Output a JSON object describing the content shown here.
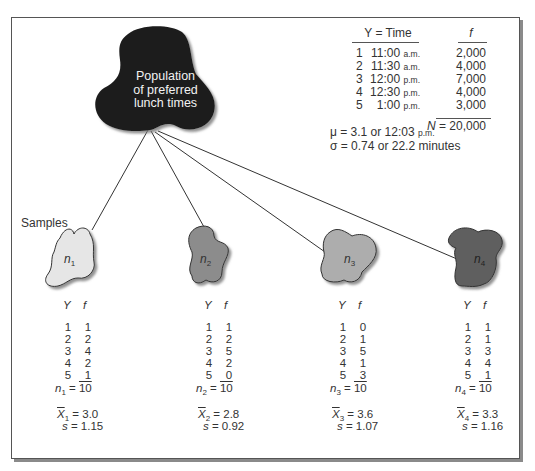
{
  "population": {
    "label_lines": [
      "Population",
      "of preferred",
      "lunch times"
    ],
    "fill_color": "#1c1c1c",
    "table": {
      "header_time": "Y = Time",
      "header_f": "f",
      "rows": [
        {
          "index": "1",
          "time": "11:00",
          "period": "a.m.",
          "f": "2,000"
        },
        {
          "index": "2",
          "time": "11:30",
          "period": "a.m.",
          "f": "4,000"
        },
        {
          "index": "3",
          "time": "12:00",
          "period": "p.m.",
          "f": "7,000"
        },
        {
          "index": "4",
          "time": "12:30",
          "period": "p.m.",
          "f": "4,000"
        },
        {
          "index": "5",
          "time": "1:00",
          "period": "p.m.",
          "f": "3,000"
        }
      ],
      "total_label": "N",
      "total_value": "= 20,000"
    },
    "mu_line": "μ = 3.1 or 12:03",
    "mu_period": "p.m.",
    "sigma_line": "σ = 0.74 or 22.2 minutes"
  },
  "samples_label": "Samples",
  "samples": [
    {
      "name": "n",
      "sub": "1",
      "fill_color": "#e6e6e6",
      "header_y": "Y",
      "header_f": "f",
      "rows": [
        [
          "1",
          "1"
        ],
        [
          "2",
          "2"
        ],
        [
          "3",
          "4"
        ],
        [
          "4",
          "2"
        ],
        [
          "5",
          "1"
        ]
      ],
      "n_value": "10",
      "mean_label": "X",
      "mean_value": "= 3.0",
      "s_label": "s",
      "s_value": "= 1.15"
    },
    {
      "name": "n",
      "sub": "2",
      "fill_color": "#8c8c8c",
      "header_y": "Y",
      "header_f": "f",
      "rows": [
        [
          "1",
          "1"
        ],
        [
          "2",
          "2"
        ],
        [
          "3",
          "5"
        ],
        [
          "4",
          "2"
        ],
        [
          "5",
          "0"
        ]
      ],
      "n_value": "10",
      "mean_label": "X",
      "mean_value": "= 2.8",
      "s_label": "s",
      "s_value": "= 0.92"
    },
    {
      "name": "n",
      "sub": "3",
      "fill_color": "#adadad",
      "header_y": "Y",
      "header_f": "f",
      "rows": [
        [
          "1",
          "0"
        ],
        [
          "2",
          "1"
        ],
        [
          "3",
          "5"
        ],
        [
          "4",
          "1"
        ],
        [
          "5",
          "3"
        ]
      ],
      "n_value": "10",
      "mean_label": "X",
      "mean_value": "= 3.6",
      "s_label": "s",
      "s_value": "= 1.07"
    },
    {
      "name": "n",
      "sub": "4",
      "fill_color": "#5e5e5e",
      "header_y": "Y",
      "header_f": "f",
      "rows": [
        [
          "1",
          "1"
        ],
        [
          "2",
          "1"
        ],
        [
          "3",
          "3"
        ],
        [
          "4",
          "4"
        ],
        [
          "5",
          "1"
        ]
      ],
      "n_value": "10",
      "mean_label": "X",
      "mean_value": "= 3.3",
      "s_label": "s",
      "s_value": "= 1.16"
    }
  ]
}
